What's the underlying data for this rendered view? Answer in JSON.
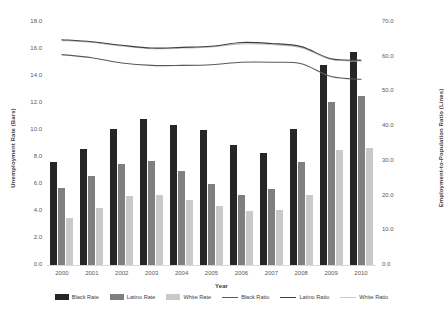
{
  "chart_data": {
    "type": "bar",
    "title": "",
    "xlabel": "Year",
    "ylabel": "Unemployment Rate (Bars)",
    "y2label": "Employment-to-Population Ratio (Lines)",
    "categories": [
      "2000",
      "2001",
      "2002",
      "2003",
      "2004",
      "2005",
      "2006",
      "2007",
      "2008",
      "2009",
      "2010"
    ],
    "ylim": [
      0.0,
      18.0
    ],
    "ytick_labels": [
      "0.0",
      "2.0",
      "4.0",
      "6.0",
      "8.0",
      "10.0",
      "12.0",
      "14.0",
      "16.0",
      "18.0"
    ],
    "ytick_values": [
      0.0,
      2.0,
      4.0,
      6.0,
      8.0,
      10.0,
      12.0,
      14.0,
      16.0,
      18.0
    ],
    "y2lim": [
      0.0,
      70.0
    ],
    "y2tick_labels": [
      "0.0",
      "10.0",
      "20.0",
      "30.0",
      "40.0",
      "50.0",
      "60.0",
      "70.0"
    ],
    "y2tick_values": [
      0.0,
      10.0,
      20.0,
      30.0,
      40.0,
      50.0,
      60.0,
      70.0
    ],
    "grid": false,
    "legend_position": "bottom",
    "bar_series": [
      {
        "name": "Black Rate",
        "color": "#262626",
        "axis": "left",
        "values": [
          7.6,
          8.6,
          10.1,
          10.8,
          10.4,
          10.0,
          8.9,
          8.3,
          10.1,
          14.8,
          15.8
        ]
      },
      {
        "name": "Latino Rate",
        "color": "#7f7f7f",
        "axis": "left",
        "values": [
          5.7,
          6.6,
          7.5,
          7.7,
          7.0,
          6.0,
          5.2,
          5.6,
          7.6,
          12.1,
          12.5
        ]
      },
      {
        "name": "White Rate",
        "color": "#c9c9c9",
        "axis": "left",
        "values": [
          3.5,
          4.2,
          5.1,
          5.2,
          4.8,
          4.4,
          4.0,
          4.1,
          5.2,
          8.5,
          8.7
        ]
      }
    ],
    "line_series": [
      {
        "name": "Black Ratio",
        "color": "#595959",
        "axis": "right",
        "values": [
          60.6,
          59.7,
          58.2,
          57.5,
          57.5,
          57.7,
          58.4,
          58.4,
          58.0,
          54.3,
          53.5
        ]
      },
      {
        "name": "Latino Ratio",
        "color": "#404040",
        "axis": "right",
        "values": [
          64.9,
          64.3,
          63.3,
          62.5,
          62.7,
          63.0,
          64.1,
          63.8,
          62.9,
          59.4,
          59.0
        ]
      },
      {
        "name": "White Ratio",
        "color": "#bfbfbf",
        "axis": "right",
        "values": [
          64.7,
          64.1,
          63.1,
          62.3,
          62.5,
          62.8,
          63.7,
          63.5,
          62.6,
          59.2,
          58.8
        ]
      }
    ]
  },
  "legend": {
    "items": [
      {
        "label": "Black Rate",
        "marker": "bar",
        "color": "#262626"
      },
      {
        "label": "Latino Rate",
        "marker": "bar",
        "color": "#7f7f7f"
      },
      {
        "label": "White Rate",
        "marker": "bar",
        "color": "#c9c9c9"
      },
      {
        "label": "Black Ratio",
        "marker": "line",
        "color": "#595959"
      },
      {
        "label": "Latino Ratio",
        "marker": "line",
        "color": "#404040"
      },
      {
        "label": "White Ratio",
        "marker": "line",
        "color": "#cccccc"
      }
    ]
  }
}
